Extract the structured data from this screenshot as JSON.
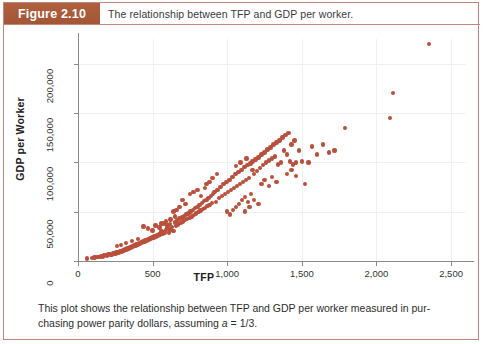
{
  "figure": {
    "number_label": "Figure 2.10",
    "header_title": "The relationship between TFP and GDP per worker.",
    "caption_text_1": "This plot shows the relationship between TFP and GDP per worker measured in pur-",
    "caption_text_2": "chasing power parity dollars, assuming ",
    "caption_symbol": "a",
    "caption_text_3": " = 1/3.",
    "accent_color": "#a8583a",
    "marker_color": "#b9503c",
    "border_color": "#c08878"
  },
  "chart_data": {
    "type": "scatter",
    "title": "The relationship between TFP and GDP per worker.",
    "xlabel": "TFP",
    "ylabel": "GDP per Worker",
    "xlim": [
      0,
      2600
    ],
    "ylim": [
      0,
      225000
    ],
    "grid": true,
    "legend": null,
    "xticks": [
      0,
      500,
      1000,
      1500,
      2000,
      2500
    ],
    "xtick_labels": [
      "0",
      "500",
      "1,000",
      "1,500",
      "2,000",
      "2,500"
    ],
    "yticks": [
      0,
      50000,
      100000,
      150000,
      200000
    ],
    "ytick_labels": [
      "0",
      "50,000",
      "100,000",
      "150,000",
      "200,000"
    ],
    "marker_color": "#b9503c",
    "points": [
      [
        60,
        2500
      ],
      [
        95,
        3000
      ],
      [
        110,
        3500
      ],
      [
        130,
        4000
      ],
      [
        145,
        4200
      ],
      [
        155,
        5000
      ],
      [
        165,
        4500
      ],
      [
        175,
        5500
      ],
      [
        185,
        6000
      ],
      [
        195,
        5200
      ],
      [
        205,
        6500
      ],
      [
        215,
        7000
      ],
      [
        225,
        6200
      ],
      [
        235,
        7500
      ],
      [
        240,
        8000
      ],
      [
        250,
        7200
      ],
      [
        258,
        8500
      ],
      [
        265,
        9000
      ],
      [
        272,
        8200
      ],
      [
        280,
        9500
      ],
      [
        288,
        10000
      ],
      [
        295,
        9200
      ],
      [
        302,
        11000
      ],
      [
        310,
        10500
      ],
      [
        318,
        12000
      ],
      [
        325,
        11500
      ],
      [
        332,
        13000
      ],
      [
        340,
        12500
      ],
      [
        348,
        14000
      ],
      [
        355,
        13500
      ],
      [
        362,
        15000
      ],
      [
        370,
        14500
      ],
      [
        378,
        16000
      ],
      [
        385,
        15200
      ],
      [
        392,
        17000
      ],
      [
        400,
        16500
      ],
      [
        408,
        18000
      ],
      [
        415,
        17200
      ],
      [
        422,
        19000
      ],
      [
        430,
        18500
      ],
      [
        438,
        20000
      ],
      [
        445,
        19200
      ],
      [
        452,
        21000
      ],
      [
        460,
        20500
      ],
      [
        468,
        22000
      ],
      [
        475,
        21200
      ],
      [
        483,
        23000
      ],
      [
        490,
        22500
      ],
      [
        498,
        24000
      ],
      [
        505,
        23200
      ],
      [
        512,
        25000
      ],
      [
        520,
        24500
      ],
      [
        528,
        26000
      ],
      [
        535,
        25200
      ],
      [
        542,
        27000
      ],
      [
        550,
        26500
      ],
      [
        558,
        28000
      ],
      [
        565,
        27200
      ],
      [
        572,
        29000
      ],
      [
        580,
        28500
      ],
      [
        440,
        35000
      ],
      [
        470,
        33000
      ],
      [
        500,
        31000
      ],
      [
        520,
        36000
      ],
      [
        545,
        34000
      ],
      [
        560,
        30000
      ],
      [
        575,
        38000
      ],
      [
        590,
        31500
      ],
      [
        600,
        33500
      ],
      [
        610,
        29000
      ],
      [
        620,
        32000
      ],
      [
        600,
        36000
      ],
      [
        615,
        37500
      ],
      [
        630,
        34500
      ],
      [
        640,
        30500
      ],
      [
        650,
        39000
      ],
      [
        658,
        35500
      ],
      [
        665,
        41000
      ],
      [
        672,
        37000
      ],
      [
        680,
        43000
      ],
      [
        688,
        38500
      ],
      [
        695,
        44000
      ],
      [
        702,
        40000
      ],
      [
        710,
        45000
      ],
      [
        718,
        41500
      ],
      [
        725,
        47000
      ],
      [
        732,
        42500
      ],
      [
        740,
        48000
      ],
      [
        748,
        43500
      ],
      [
        755,
        50000
      ],
      [
        762,
        45000
      ],
      [
        770,
        52000
      ],
      [
        778,
        46500
      ],
      [
        785,
        54000
      ],
      [
        792,
        48000
      ],
      [
        800,
        55000
      ],
      [
        808,
        49500
      ],
      [
        815,
        57000
      ],
      [
        822,
        51000
      ],
      [
        830,
        59000
      ],
      [
        838,
        52500
      ],
      [
        845,
        61000
      ],
      [
        852,
        54000
      ],
      [
        860,
        62000
      ],
      [
        868,
        55500
      ],
      [
        875,
        64000
      ],
      [
        882,
        57000
      ],
      [
        890,
        66000
      ],
      [
        898,
        58500
      ],
      [
        905,
        68000
      ],
      [
        750,
        68000
      ],
      [
        775,
        70000
      ],
      [
        800,
        72000
      ],
      [
        825,
        66000
      ],
      [
        850,
        74000
      ],
      [
        700,
        62000
      ],
      [
        720,
        58000
      ],
      [
        680,
        55000
      ],
      [
        660,
        52000
      ],
      [
        640,
        50000
      ],
      [
        915,
        70000
      ],
      [
        925,
        60000
      ],
      [
        935,
        72000
      ],
      [
        945,
        64000
      ],
      [
        955,
        75000
      ],
      [
        965,
        66000
      ],
      [
        975,
        78000
      ],
      [
        985,
        68000
      ],
      [
        995,
        80000
      ],
      [
        1005,
        70000
      ],
      [
        1015,
        82000
      ],
      [
        1025,
        72000
      ],
      [
        1035,
        85000
      ],
      [
        1045,
        74000
      ],
      [
        1055,
        88000
      ],
      [
        1065,
        76000
      ],
      [
        1075,
        90000
      ],
      [
        1085,
        78000
      ],
      [
        1095,
        92000
      ],
      [
        1105,
        80000
      ],
      [
        1115,
        95000
      ],
      [
        1125,
        82000
      ],
      [
        1135,
        97000
      ],
      [
        1145,
        84000
      ],
      [
        1155,
        99000
      ],
      [
        1000,
        50000
      ],
      [
        1020,
        47000
      ],
      [
        1040,
        52000
      ],
      [
        1060,
        55000
      ],
      [
        1080,
        58000
      ],
      [
        1100,
        62000
      ],
      [
        1120,
        65000
      ],
      [
        1140,
        60000
      ],
      [
        1160,
        68000
      ],
      [
        1170,
        101000
      ],
      [
        1180,
        88000
      ],
      [
        1190,
        103000
      ],
      [
        1200,
        91000
      ],
      [
        1210,
        105000
      ],
      [
        1220,
        94000
      ],
      [
        1230,
        108000
      ],
      [
        1240,
        97000
      ],
      [
        1250,
        110000
      ],
      [
        1260,
        100000
      ],
      [
        1270,
        113000
      ],
      [
        1280,
        102000
      ],
      [
        1290,
        115000
      ],
      [
        1300,
        104000
      ],
      [
        1310,
        118000
      ],
      [
        1320,
        106000
      ],
      [
        1330,
        120000
      ],
      [
        1340,
        98000
      ],
      [
        1350,
        122000
      ],
      [
        1360,
        100000
      ],
      [
        1230,
        78000
      ],
      [
        1250,
        82000
      ],
      [
        1280,
        76000
      ],
      [
        1300,
        85000
      ],
      [
        1330,
        80000
      ],
      [
        1370,
        125000
      ],
      [
        1380,
        112000
      ],
      [
        1390,
        128000
      ],
      [
        1400,
        108000
      ],
      [
        1410,
        130000
      ],
      [
        1420,
        101000
      ],
      [
        1430,
        118000
      ],
      [
        1440,
        98000
      ],
      [
        1450,
        122000
      ],
      [
        1460,
        100000
      ],
      [
        1400,
        88000
      ],
      [
        1430,
        92000
      ],
      [
        1460,
        86000
      ],
      [
        1480,
        112000
      ],
      [
        1500,
        101000
      ],
      [
        1520,
        78000
      ],
      [
        1545,
        100000
      ],
      [
        1570,
        116000
      ],
      [
        1600,
        108000
      ],
      [
        1640,
        118000
      ],
      [
        1680,
        110000
      ],
      [
        1720,
        112000
      ],
      [
        1790,
        135000
      ],
      [
        2090,
        145000
      ],
      [
        2110,
        170000
      ],
      [
        2350,
        220000
      ],
      [
        1180,
        62000
      ],
      [
        1210,
        58000
      ],
      [
        1150,
        55000
      ],
      [
        1120,
        50000
      ],
      [
        320,
        18000
      ],
      [
        360,
        20000
      ],
      [
        400,
        22000
      ],
      [
        260,
        15000
      ],
      [
        290,
        16500
      ],
      [
        620,
        42000
      ],
      [
        650,
        45000
      ],
      [
        590,
        40000
      ],
      [
        560,
        38000
      ],
      [
        880,
        80000
      ],
      [
        900,
        84000
      ],
      [
        860,
        78000
      ],
      [
        930,
        88000
      ],
      [
        1060,
        96000
      ],
      [
        1090,
        100000
      ],
      [
        1130,
        104000
      ],
      [
        1170,
        92000
      ]
    ]
  }
}
